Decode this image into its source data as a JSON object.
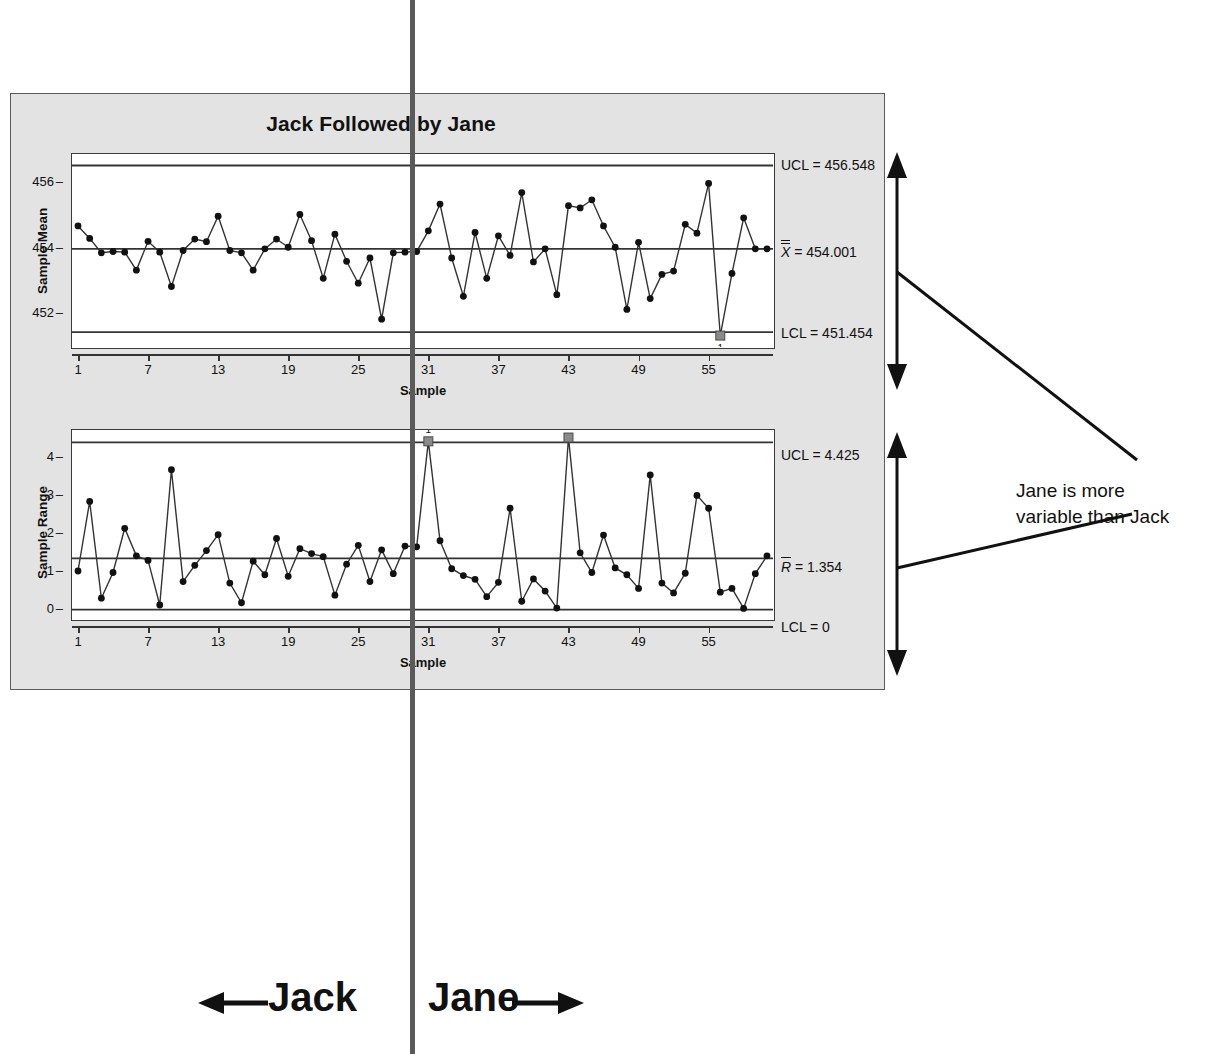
{
  "figure": {
    "title": "Jack Followed by Jane",
    "divider_note": "vertical divider between Jack and Jane periods",
    "left_period_label": "Jack",
    "right_period_label": "Jane",
    "annotation": {
      "line1": "Jane is more",
      "line2": "variable than Jack"
    }
  },
  "xbar_chart": {
    "ylabel": "Sample Mean",
    "xlabel": "Sample",
    "yticks": [
      "456",
      "454",
      "452"
    ],
    "xticks": [
      "1",
      "7",
      "13",
      "19",
      "25",
      "31",
      "37",
      "43",
      "49",
      "55"
    ],
    "ucl_label": "UCL = 456.548",
    "center_label_prefix": "X",
    "center_label_suffix": " = 454.001",
    "lcl_label": "LCL = 451.454",
    "ucl": 456.548,
    "center": 454.001,
    "lcl": 451.454,
    "ooc_marker_label": "1"
  },
  "r_chart": {
    "ylabel": "Sample Range",
    "xlabel": "Sample",
    "yticks": [
      "4",
      "3",
      "2",
      "1",
      "0"
    ],
    "xticks": [
      "1",
      "7",
      "13",
      "19",
      "25",
      "31",
      "37",
      "43",
      "49",
      "55"
    ],
    "ucl_label": "UCL = 4.425",
    "center_label_prefix": "R",
    "center_label_suffix": " = 1.354",
    "lcl_label": "LCL = 0",
    "ucl": 4.425,
    "center": 1.354,
    "lcl": 0,
    "ooc_marker_label": "1"
  },
  "colors": {
    "panel_background": "#e3e3e3",
    "plot_background": "#ffffff",
    "line": "#333333",
    "marker": "#111111",
    "ooc_marker": "#8a8a8a",
    "divider": "#5a5a5a"
  },
  "chart_data": [
    {
      "type": "line",
      "title": "Jack Followed by Jane",
      "name": "xbar-chart",
      "xlabel": "Sample",
      "ylabel": "Sample Mean",
      "ylim": [
        451.0,
        456.9
      ],
      "xlim": [
        1,
        60
      ],
      "yticks": [
        452,
        454,
        456
      ],
      "xticks": [
        1,
        7,
        13,
        19,
        25,
        31,
        37,
        43,
        49,
        55
      ],
      "grid": false,
      "legend": null,
      "control_limits": {
        "UCL": 456.548,
        "CL": 454.001,
        "LCL": 451.454
      },
      "x": [
        1,
        2,
        3,
        4,
        5,
        6,
        7,
        8,
        9,
        10,
        11,
        12,
        13,
        14,
        15,
        16,
        17,
        18,
        19,
        20,
        21,
        22,
        23,
        24,
        25,
        26,
        27,
        28,
        29,
        30,
        31,
        32,
        33,
        34,
        35,
        36,
        37,
        38,
        39,
        40,
        41,
        42,
        43,
        44,
        45,
        46,
        47,
        48,
        49,
        50,
        51,
        52,
        53,
        54,
        55,
        56,
        57,
        58,
        59,
        60
      ],
      "values": [
        454.7,
        454.32,
        453.88,
        453.92,
        453.9,
        453.35,
        454.23,
        453.9,
        452.85,
        453.95,
        454.3,
        454.22,
        455.0,
        453.95,
        453.88,
        453.35,
        454.0,
        454.3,
        454.05,
        455.05,
        454.25,
        453.1,
        454.45,
        453.62,
        452.95,
        453.72,
        451.85,
        453.88,
        453.9,
        453.92,
        454.55,
        455.37,
        453.72,
        452.55,
        454.5,
        453.1,
        454.4,
        453.8,
        455.72,
        453.6,
        454.0,
        452.6,
        455.32,
        455.25,
        455.5,
        454.7,
        454.05,
        452.15,
        454.2,
        452.48,
        453.22,
        453.32,
        454.75,
        454.48,
        456.0,
        451.35,
        453.25,
        454.95,
        454.0,
        454.0
      ],
      "out_of_control_points": [
        {
          "x": 56,
          "y": 451.35,
          "label": "1"
        }
      ]
    },
    {
      "type": "line",
      "name": "r-chart",
      "xlabel": "Sample",
      "ylabel": "Sample Range",
      "ylim": [
        -0.25,
        4.75
      ],
      "xlim": [
        1,
        60
      ],
      "yticks": [
        0,
        1,
        2,
        3,
        4
      ],
      "xticks": [
        1,
        7,
        13,
        19,
        25,
        31,
        37,
        43,
        49,
        55
      ],
      "grid": false,
      "legend": null,
      "control_limits": {
        "UCL": 4.425,
        "CL": 1.354,
        "LCL": 0
      },
      "x": [
        1,
        2,
        3,
        4,
        5,
        6,
        7,
        8,
        9,
        10,
        11,
        12,
        13,
        14,
        15,
        16,
        17,
        18,
        19,
        20,
        21,
        22,
        23,
        24,
        25,
        26,
        27,
        28,
        29,
        30,
        31,
        32,
        33,
        34,
        35,
        36,
        37,
        38,
        39,
        40,
        41,
        42,
        43,
        44,
        45,
        46,
        47,
        48,
        49,
        50,
        51,
        52,
        53,
        54,
        55,
        56,
        57,
        58,
        59,
        60
      ],
      "values": [
        1.02,
        2.86,
        0.3,
        0.98,
        2.15,
        1.42,
        1.3,
        0.12,
        3.7,
        0.74,
        1.17,
        1.56,
        1.98,
        0.7,
        0.18,
        1.28,
        0.92,
        1.88,
        0.88,
        1.61,
        1.48,
        1.4,
        0.38,
        1.2,
        1.7,
        0.74,
        1.58,
        0.95,
        1.68,
        1.66,
        4.45,
        1.82,
        1.08,
        0.9,
        0.8,
        0.34,
        0.72,
        2.68,
        0.22,
        0.81,
        0.49,
        0.04,
        4.55,
        1.5,
        0.98,
        1.97,
        1.1,
        0.92,
        0.56,
        3.56,
        0.7,
        0.44,
        0.96,
        3.02,
        2.68,
        0.46,
        0.56,
        0.03,
        0.95,
        1.42
      ],
      "out_of_control_points": [
        {
          "x": 31,
          "y": 4.45,
          "label": "1"
        },
        {
          "x": 43,
          "y": 4.55,
          "label": ""
        }
      ]
    }
  ]
}
